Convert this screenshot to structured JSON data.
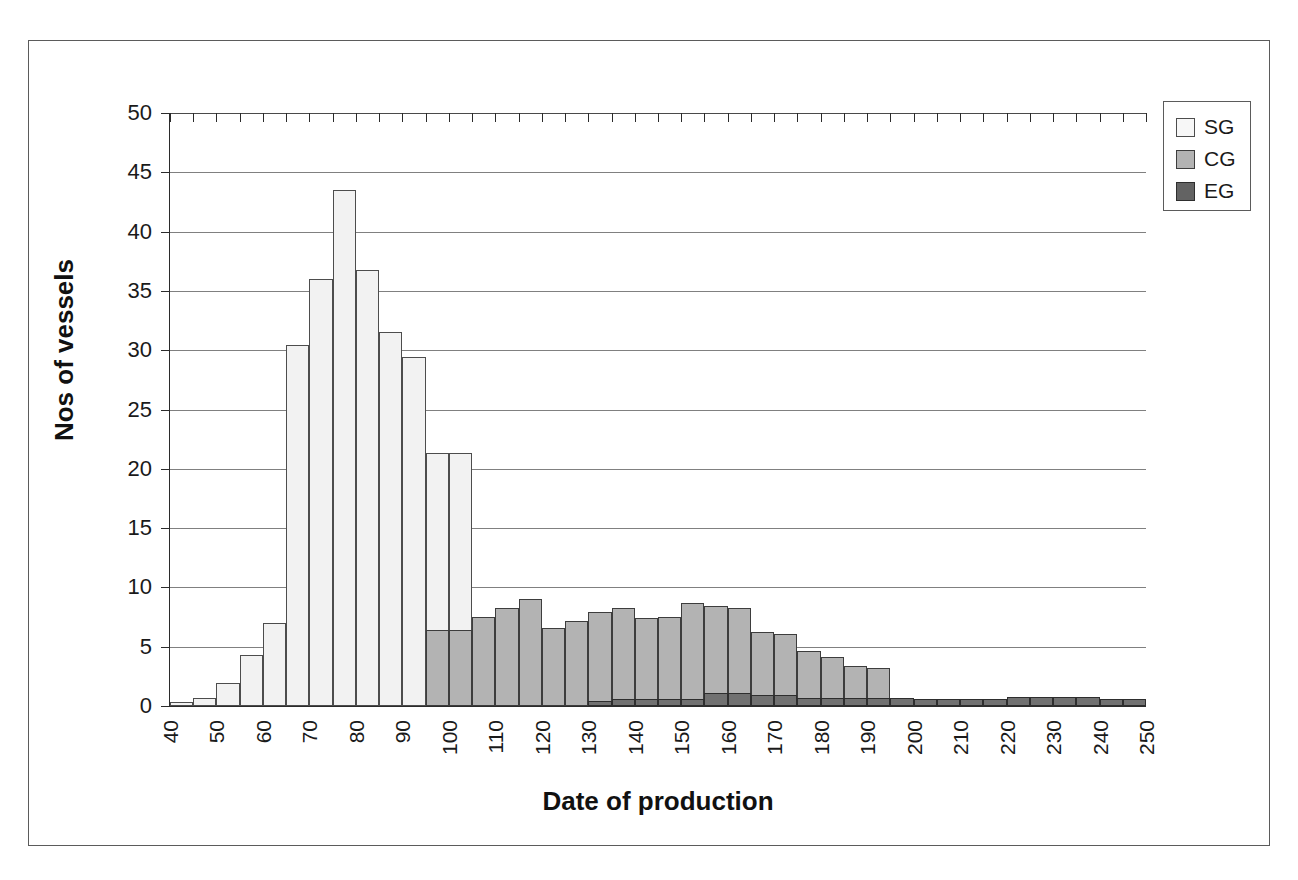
{
  "chart_data": {
    "type": "bar",
    "title": "",
    "subtitle": "",
    "xlabel": "Date of production",
    "ylabel": "Nos of vessels",
    "xlim": [
      40,
      250
    ],
    "ylim": [
      0,
      50
    ],
    "y_ticks": [
      0,
      5,
      10,
      15,
      20,
      25,
      30,
      35,
      40,
      45,
      50
    ],
    "x_ticks": [
      40,
      50,
      60,
      70,
      80,
      90,
      100,
      110,
      120,
      130,
      140,
      150,
      160,
      170,
      180,
      190,
      200,
      210,
      220,
      230,
      240,
      250
    ],
    "bin_width": 5,
    "grid": "horizontal",
    "legend_position": "top-right",
    "overlap_style": "overlapping-bars",
    "bin_starts": [
      40,
      45,
      50,
      55,
      60,
      65,
      70,
      75,
      80,
      85,
      90,
      95,
      100,
      105,
      110,
      115,
      120,
      125,
      130,
      135,
      140,
      145,
      150,
      155,
      160,
      165,
      170,
      175,
      180,
      185,
      190,
      195,
      200,
      205,
      210,
      215,
      220,
      225,
      230,
      235,
      240,
      245
    ],
    "series": [
      {
        "name": "SG",
        "color": "#f2f2f2",
        "values": [
          0.3,
          0.7,
          1.9,
          4.3,
          7.0,
          30.4,
          36.0,
          43.5,
          36.8,
          31.5,
          29.4,
          21.3,
          21.3,
          0,
          0,
          0,
          0,
          0,
          0,
          0,
          0,
          0,
          0,
          0,
          0,
          0,
          0,
          0,
          0,
          0,
          0,
          0,
          0,
          0,
          0,
          0,
          0,
          0,
          0,
          0,
          0,
          0
        ]
      },
      {
        "name": "CG",
        "color": "#b3b3b3",
        "values": [
          0,
          0,
          0,
          0,
          0,
          0,
          0,
          0,
          0,
          0,
          0,
          6.4,
          6.4,
          7.5,
          8.3,
          9.0,
          6.6,
          7.2,
          7.9,
          8.3,
          7.4,
          7.5,
          8.7,
          8.4,
          8.3,
          6.2,
          6.1,
          4.6,
          4.1,
          3.4,
          3.2,
          0,
          0,
          0,
          0,
          0,
          0,
          0,
          0,
          0,
          0,
          0
        ]
      },
      {
        "name": "EG",
        "color": "#717171",
        "values": [
          0,
          0,
          0,
          0,
          0,
          0,
          0,
          0,
          0,
          0,
          0,
          0,
          0,
          0,
          0,
          0,
          0,
          0,
          0.4,
          0.6,
          0.6,
          0.6,
          0.6,
          1.1,
          1.1,
          0.9,
          0.9,
          0.7,
          0.7,
          0.7,
          0.7,
          0.7,
          0.6,
          0.6,
          0.6,
          0.6,
          0.8,
          0.8,
          0.8,
          0.8,
          0.6,
          0.6
        ]
      }
    ],
    "legend": [
      {
        "label": "SG",
        "swatch": "sg"
      },
      {
        "label": "CG",
        "swatch": "cg"
      },
      {
        "label": "EG",
        "swatch": "eg"
      }
    ]
  }
}
